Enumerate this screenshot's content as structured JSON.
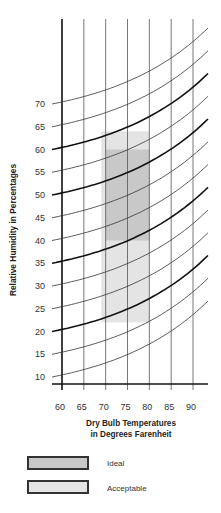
{
  "chart_data": {
    "type": "line",
    "title": "",
    "xlabel": "Dry Bulb Temperatures in Degrees Farenheit",
    "xlabel_lines": [
      "Dry Bulb Temperatures",
      "in Degrees Farenheit"
    ],
    "ylabel": "Relative Humidity in Percentages",
    "x_ticks": [
      60,
      65,
      70,
      75,
      80,
      85,
      90
    ],
    "y_ticks": [
      10,
      15,
      20,
      25,
      30,
      35,
      40,
      45,
      50,
      55,
      60,
      65,
      70
    ],
    "xlim": [
      57,
      93
    ],
    "ylim": [
      8,
      70
    ],
    "grid": true,
    "curves_note": "Curved relative humidity lines rising from left to right across the temperature range; heavier lines at 20, 35, 50 and 60",
    "series": [
      {
        "name": "RH 10",
        "start_label": 10,
        "emphasis": false
      },
      {
        "name": "RH 15",
        "start_label": 15,
        "emphasis": false
      },
      {
        "name": "RH 20",
        "start_label": 20,
        "emphasis": true
      },
      {
        "name": "RH 25",
        "start_label": 25,
        "emphasis": false
      },
      {
        "name": "RH 30",
        "start_label": 30,
        "emphasis": false
      },
      {
        "name": "RH 35",
        "start_label": 35,
        "emphasis": true
      },
      {
        "name": "RH 40",
        "start_label": 40,
        "emphasis": false
      },
      {
        "name": "RH 45",
        "start_label": 45,
        "emphasis": false
      },
      {
        "name": "RH 50",
        "start_label": 50,
        "emphasis": true
      },
      {
        "name": "RH 55",
        "start_label": 55,
        "emphasis": false
      },
      {
        "name": "RH 60",
        "start_label": 60,
        "emphasis": true
      },
      {
        "name": "RH 65",
        "start_label": 65,
        "emphasis": false
      },
      {
        "name": "RH 70",
        "start_label": 70,
        "emphasis": false
      }
    ],
    "regions": [
      {
        "name": "Acceptable",
        "x_range": [
          69,
          80
        ],
        "y_range": [
          22,
          64
        ],
        "color": "#e4e4e4"
      },
      {
        "name": "Ideal",
        "x_range": [
          70,
          80
        ],
        "y_range": [
          40,
          60
        ],
        "color": "#c8c8c8"
      }
    ],
    "legend": [
      {
        "label": "Ideal",
        "color": "#c8c8c8"
      },
      {
        "label": "Acceptable",
        "color": "#e4e4e4"
      }
    ],
    "legend_position": "bottom"
  },
  "x_title": {
    "line1": "Dry Bulb Temperatures",
    "line2": "in Degrees Farenheit"
  },
  "y_title": "Relative Humidity in Percentages",
  "legend": {
    "ideal": "Ideal",
    "acceptable": "Acceptable"
  }
}
